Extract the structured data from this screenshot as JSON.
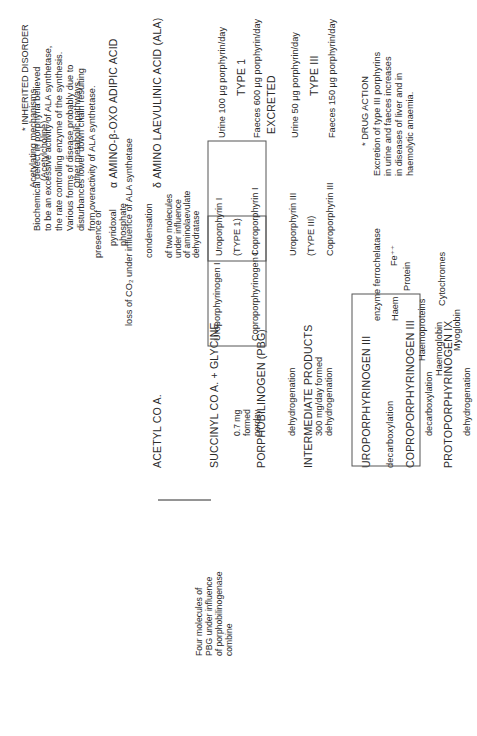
{
  "main_chain": {
    "acetyl": "ACETYL CO A.",
    "succinyl": "SUCCINYL CO A. + GLYCINE",
    "pbg": "PORPHOBILINOGEN (PBG)",
    "intermediate": "INTERMEDIATE PRODUCTS",
    "uroporphyrinogen3": "UROPORPHYRINOGEN III",
    "coproporphyrinogen3": "COPROPORPHYRINOGEN III",
    "protoporphyrinogen9": "PROTOPORPHYRINOGEN IX",
    "protoporphyrin": "PROTOPORPHYRIN"
  },
  "acetyl_branches": {
    "acetylating_1": "Acetylating mechanisms",
    "acetylating_2": "(Acetylcholine)",
    "other": "Other metabolic pathways"
  },
  "ala_branch": {
    "presence_1": "presence of",
    "pyridoxal_1": "pyridoxal",
    "pyridoxal_2": "phosphate",
    "amino_oxo": "α AMINO-β-OXO ADIPIC ACID",
    "loss_co2": "loss of CO₂ under influence of ALA synthetase",
    "ala": "δ AMINO LAEVULINIC ACID (ALA)",
    "condensation": "condensation",
    "cond_1": "of two molecules",
    "cond_2": "under influence",
    "cond_3": "of aminolaevulate",
    "cond_4": "dehydratase"
  },
  "four_molecules": {
    "l1": "Four molecules of",
    "l2": "PBG under influence",
    "l3": "of porphobilinogenase",
    "l4": "combine"
  },
  "type1_path": {
    "uroporphyrinogen1": "Uroporphyrinogen I",
    "coproporphyrinogen1": "Coproporphyrinogen I",
    "formed_1": "0.7 mg",
    "formed_2": "formed",
    "formed_3": "perday",
    "box_uro": "Uroporphyrin I",
    "box_type": "(TYPE 1)",
    "box_copro": "Coproporphyrin I"
  },
  "type3_path": {
    "dehydrogenation_a": "dehydrogenation",
    "formed_300": "300 mg/day formed",
    "dehydrogenation_b": "dehydrogenation",
    "box_uro": "Uroporphyrin III",
    "box_type": "(TYPE III)",
    "box_copro": "Coproporphyrin III"
  },
  "steps": {
    "decarboxylation_1": "decarboxylation",
    "decarboxylation_2": "decarboxylation",
    "dehydrogenation": "dehydrogenation"
  },
  "excretion": {
    "excreted": "EXCRETED",
    "type1": "TYPE 1",
    "type3": "TYPE III",
    "urine_1": "Urine 100 μg porphyrin/day",
    "faeces_1": "Faeces 600 μg porphyrin/day",
    "urine_3": "Urine 50 μg porphyrin/day",
    "faeces_3": "Faeces 150 μg porphyrin/day"
  },
  "inherited_note": {
    "heading": "* INHERITED DISORDER",
    "lines": [
      "Biochemical defect in porphyria believed",
      "to be an excessive activity of ALA synthetase,",
      "the rate controlling enzyme of the synthesis.",
      "Various forms of disease probably due to",
      "disturbances lower down chain resulting",
      "from overactivity of ALA synthetase."
    ]
  },
  "drug_note": {
    "heading": "* DRUG ACTION",
    "lines": [
      "Excretion of type III porphyrins",
      "in urine and faeces increases",
      "in diseases of liver and in",
      "haemolytic anaemia."
    ]
  },
  "haem": {
    "enzyme": "enzyme ferrochelatase",
    "fe": "Fe⁺⁺",
    "haem": "Haem",
    "protein": "Protein",
    "haemoproteins": "Haemoproteins",
    "cytochromes": "Cytochromes",
    "haemoglobin": "Haemoglobin",
    "myoglobin": "Myoglobin"
  }
}
